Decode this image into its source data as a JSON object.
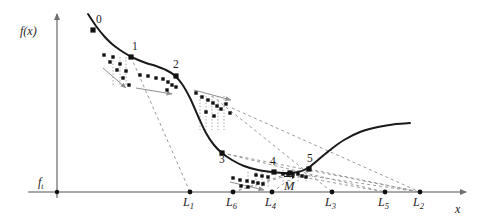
{
  "figure": {
    "type": "mathematical-diagram",
    "axes": {
      "y_axis_label": "f(x)",
      "x_axis_label": "x",
      "threshold_label": "f",
      "threshold_subscript": "t",
      "y_axis_x": 57,
      "x_axis_y": 192,
      "y_axis_top": 14,
      "x_axis_right": 466
    },
    "curve_points": [
      [
        88,
        14
      ],
      [
        96,
        26
      ],
      [
        104,
        36
      ],
      [
        112,
        44
      ],
      [
        120,
        50
      ],
      [
        128,
        55
      ],
      [
        136,
        59
      ],
      [
        146,
        63
      ],
      [
        156,
        66
      ],
      [
        166,
        70
      ],
      [
        174,
        75
      ],
      [
        182,
        84
      ],
      [
        190,
        98
      ],
      [
        198,
        116
      ],
      [
        206,
        133
      ],
      [
        214,
        145
      ],
      [
        222,
        153
      ],
      [
        232,
        160
      ],
      [
        244,
        166
      ],
      [
        258,
        170
      ],
      [
        272,
        172
      ],
      [
        286,
        173
      ],
      [
        298,
        172
      ],
      [
        308,
        168
      ],
      [
        318,
        160
      ],
      [
        330,
        150
      ],
      [
        344,
        140
      ],
      [
        360,
        132
      ],
      [
        378,
        127
      ],
      [
        396,
        124
      ],
      [
        410,
        123
      ]
    ],
    "labeled_points": [
      {
        "id": "0",
        "label": "0",
        "x": 93,
        "y": 30,
        "label_x": 96,
        "label_y": 14
      },
      {
        "id": "1",
        "label": "1",
        "x": 131,
        "y": 57,
        "label_x": 132,
        "label_y": 41
      },
      {
        "id": "2",
        "label": "2",
        "x": 176,
        "y": 76,
        "label_x": 173,
        "label_y": 59
      },
      {
        "id": "3",
        "label": "3",
        "x": 222,
        "y": 153,
        "label_x": 219,
        "label_y": 154
      },
      {
        "id": "4",
        "label": "4",
        "x": 274,
        "y": 172,
        "label_x": 270,
        "label_y": 156
      },
      {
        "id": "5",
        "label": "5",
        "x": 309,
        "y": 169,
        "label_x": 307,
        "label_y": 153
      },
      {
        "id": "M",
        "label": "M",
        "x": 290,
        "y": 173,
        "label_x": 284,
        "label_y": 176
      }
    ],
    "axis_intercepts": [
      {
        "id": "L1",
        "label": "L",
        "subscript": "1",
        "x": 190,
        "label_x": 183,
        "label_y": 196
      },
      {
        "id": "L6",
        "label": "L",
        "subscript": "6",
        "x": 233,
        "label_x": 226,
        "label_y": 196
      },
      {
        "id": "L4",
        "label": "L",
        "subscript": "4",
        "x": 272,
        "label_x": 265,
        "label_y": 196
      },
      {
        "id": "L3",
        "label": "L",
        "subscript": "3",
        "x": 332,
        "label_x": 325,
        "label_y": 196
      },
      {
        "id": "L5",
        "label": "L",
        "subscript": "5",
        "x": 385,
        "label_x": 378,
        "label_y": 196
      },
      {
        "id": "L2",
        "label": "L",
        "subscript": "2",
        "x": 420,
        "label_x": 413,
        "label_y": 196
      }
    ],
    "secant_lines": [
      {
        "from": [
          131,
          57
        ],
        "to": [
          190,
          192
        ]
      },
      {
        "from": [
          222,
          153
        ],
        "to": [
          420,
          192
        ]
      },
      {
        "from": [
          222,
          153
        ],
        "to": [
          385,
          192
        ]
      },
      {
        "from": [
          232,
          108
        ],
        "to": [
          420,
          192
        ]
      },
      {
        "from": [
          212,
          96
        ],
        "to": [
          332,
          192
        ]
      },
      {
        "from": [
          233,
          192
        ],
        "to": [
          290,
          173
        ]
      },
      {
        "from": [
          233,
          192
        ],
        "to": [
          309,
          169
        ]
      },
      {
        "from": [
          290,
          173
        ],
        "to": [
          420,
          192
        ]
      },
      {
        "from": [
          309,
          169
        ],
        "to": [
          420,
          192
        ]
      },
      {
        "from": [
          272,
          192
        ],
        "to": [
          332,
          150
        ]
      },
      {
        "from": [
          274,
          172
        ],
        "to": [
          385,
          192
        ]
      }
    ],
    "dot_clusters": [
      {
        "name": "cluster-0-to-1",
        "dots": [
          [
            104,
            55
          ],
          [
            110,
            62
          ],
          [
            113,
            57
          ],
          [
            117,
            70
          ],
          [
            120,
            64
          ],
          [
            123,
            78
          ],
          [
            126,
            71
          ],
          [
            129,
            85
          ]
        ],
        "droplines_x": [
          113,
          120,
          126
        ],
        "dropline_top": 57,
        "dropline_bottom": 85,
        "arrow": {
          "from": [
            103,
            68
          ],
          "to": [
            126,
            88
          ]
        }
      },
      {
        "name": "cluster-1-to-2",
        "dots": [
          [
            140,
            75
          ],
          [
            148,
            76
          ],
          [
            156,
            78
          ],
          [
            163,
            79
          ],
          [
            168,
            82
          ],
          [
            172,
            85
          ],
          [
            176,
            87
          ],
          [
            167,
            90
          ]
        ],
        "arrow": {
          "from": [
            136,
            88
          ],
          "to": [
            172,
            94
          ]
        }
      },
      {
        "name": "cluster-2-to-3",
        "dots": [
          [
            196,
            93
          ],
          [
            202,
            97
          ],
          [
            208,
            100
          ],
          [
            213,
            103
          ],
          [
            217,
            106
          ],
          [
            221,
            109
          ],
          [
            226,
            104
          ],
          [
            230,
            113
          ],
          [
            206,
            112
          ],
          [
            214,
            116
          ]
        ],
        "droplines_x": [
          200,
          206,
          212,
          218,
          224
        ],
        "dropline_top": 96,
        "dropline_bottom": 130,
        "arrow": {
          "from": [
            194,
            90
          ],
          "to": [
            231,
            100
          ]
        }
      },
      {
        "name": "cluster-3-to-4",
        "dots": [
          [
            233,
            178
          ],
          [
            240,
            180
          ],
          [
            247,
            181
          ],
          [
            253,
            182
          ],
          [
            258,
            183
          ],
          [
            263,
            184
          ],
          [
            248,
            187
          ],
          [
            241,
            186
          ],
          [
            256,
            175
          ],
          [
            262,
            176
          ],
          [
            268,
            177
          ]
        ],
        "droplines_x": [
          248,
          256,
          262,
          268
        ],
        "dropline_top": 172,
        "dropline_bottom": 188,
        "arrow": {
          "from": [
            230,
            182
          ],
          "to": [
            264,
            190
          ]
        }
      },
      {
        "name": "cluster-near-M",
        "dots": [
          [
            283,
            174
          ],
          [
            288,
            174
          ],
          [
            293,
            174
          ],
          [
            298,
            174
          ],
          [
            302,
            176
          ],
          [
            306,
            177
          ]
        ],
        "droplines_x": [
          283,
          290,
          298,
          306
        ],
        "dropline_top": 170,
        "dropline_bottom": 182
      }
    ]
  }
}
